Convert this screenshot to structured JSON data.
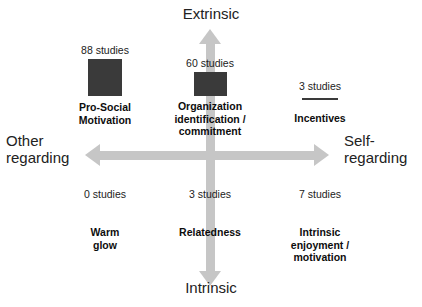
{
  "chart_data": {
    "type": "bar",
    "title": "",
    "layout": "2x2 quadrant map with bar glyphs",
    "xlabel": "Other regarding ↔ Self-regarding",
    "ylabel": "Intrinsic ↔ Extrinsic",
    "axes": {
      "vertical": {
        "top_label": "Extrinsic",
        "bottom_label": "Intrinsic",
        "arrow": "double-headed",
        "color": "#c6c6c6"
      },
      "horizontal": {
        "left_label": "Other\nregarding",
        "right_label": "Self-\nregarding",
        "arrow": "double-headed",
        "color": "#c6c6c6"
      }
    },
    "bar_color": "#3a3a3a",
    "categories": [
      "Pro-Social Motivation",
      "Organization identification / commitment",
      "Incentives",
      "Warm glow",
      "Relatedness",
      "Intrinsic enjoyment / motivation"
    ],
    "values": [
      88,
      60,
      3,
      0,
      3,
      7
    ],
    "unit": "studies"
  },
  "axis_labels": {
    "extrinsic": "Extrinsic",
    "intrinsic": "Intrinsic",
    "other_regarding": "Other\nregarding",
    "self_regarding": "Self-\nregarding"
  },
  "quadrants": [
    {
      "id": "pro-social",
      "count_label": "88 studies",
      "value": 88,
      "term": "Pro-Social\nMotivation"
    },
    {
      "id": "organization",
      "count_label": "60 studies",
      "value": 60,
      "term": "Organization\nidentification /\ncommitment"
    },
    {
      "id": "incentives",
      "count_label": "3 studies",
      "value": 3,
      "term": "Incentives"
    },
    {
      "id": "warm-glow",
      "count_label": "0 studies",
      "value": 0,
      "term": "Warm\nglow"
    },
    {
      "id": "relatedness",
      "count_label": "3 studies",
      "value": 3,
      "term": "Relatedness"
    },
    {
      "id": "intrinsic-enjoyment",
      "count_label": "7 studies",
      "value": 7,
      "term": "Intrinsic\nenjoyment /\nmotivation"
    }
  ],
  "colors": {
    "background": "#ffffff",
    "bar": "#3a3a3a",
    "axis": "#c6c6c6",
    "text": "#1a1a1a"
  }
}
